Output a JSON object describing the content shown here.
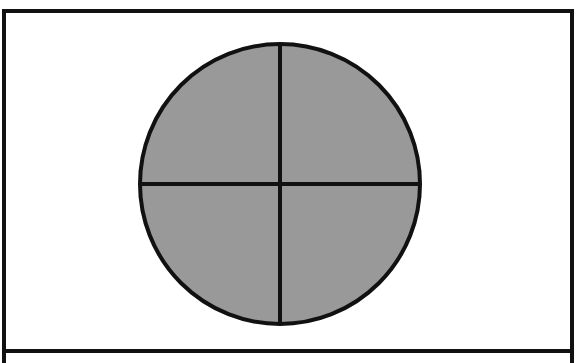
{
  "diagram": {
    "frame": {
      "x1": 4,
      "y1": 11,
      "x2": 572,
      "y2": 351,
      "stroke": "#111111"
    },
    "circle": {
      "cx": 280,
      "cy": 184,
      "r": 140,
      "fill": "#999999",
      "stroke": "#111111"
    },
    "divisions": 4,
    "colors": {
      "fill": "#999999",
      "line": "#111111",
      "background": "#ffffff"
    }
  }
}
